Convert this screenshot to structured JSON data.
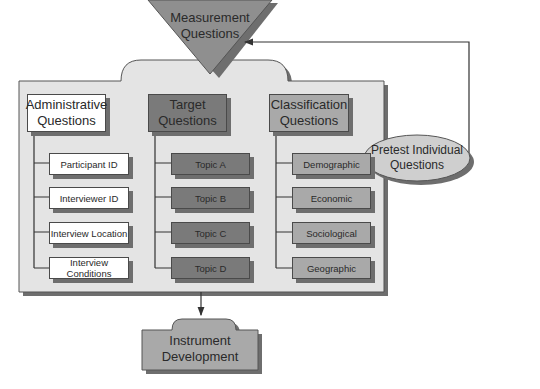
{
  "measurement": {
    "label_line1": "Measurement",
    "label_line2": "Questions"
  },
  "columns": [
    {
      "title_line1": "Administrative",
      "title_line2": "Questions",
      "items": [
        "Participant ID",
        "Interviewer ID",
        "Interview Location",
        "Interview Conditions"
      ]
    },
    {
      "title_line1": "Target",
      "title_line2": "Questions",
      "items": [
        "Topic A",
        "Topic B",
        "Topic C",
        "Topic D"
      ]
    },
    {
      "title_line1": "Classification",
      "title_line2": "Questions",
      "items": [
        "Demographic",
        "Economic",
        "Sociological",
        "Geographic"
      ]
    }
  ],
  "pretest": {
    "label_line1": "Pretest Individual",
    "label_line2": "Questions"
  },
  "instrument": {
    "label_line1": "Instrument",
    "label_line2": "Development"
  },
  "colors": {
    "container": "#e4e4e4",
    "triangle": "#8f8f8f",
    "admin": "#ffffff",
    "target": "#7a7a7a",
    "classification": "#a9a9a9",
    "instrument": "#a9a9a9",
    "ellipse": "#cfcfcf"
  }
}
